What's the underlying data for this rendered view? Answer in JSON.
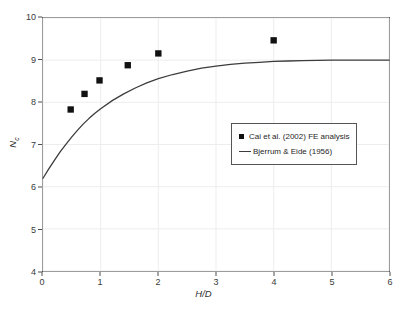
{
  "chart_data": {
    "type": "scatter",
    "title": "",
    "xlabel": "H/D",
    "ylabel": "Nc",
    "ylabel_base": "N",
    "ylabel_sub": "c",
    "xlim": [
      0,
      6
    ],
    "ylim": [
      4,
      10
    ],
    "xticks": [
      "0",
      "1",
      "2",
      "3",
      "4",
      "5",
      "6"
    ],
    "yticks": [
      "4",
      "5",
      "6",
      "7",
      "8",
      "9",
      "10"
    ],
    "grid": true,
    "legend_position": "center-right",
    "series": [
      {
        "name": "Cai et al. (2002) FE analysis",
        "type": "scatter",
        "marker": "square",
        "color": "#111111",
        "x": [
          0.48,
          0.72,
          0.98,
          1.47,
          2.0,
          4.0
        ],
        "y": [
          7.83,
          8.2,
          8.52,
          8.88,
          9.16,
          9.47
        ]
      },
      {
        "name": "Bjerrum & Eide (1956)",
        "type": "line",
        "color": "#3c3c3c",
        "x": [
          0,
          0.1,
          0.2,
          0.3,
          0.4,
          0.5,
          0.6,
          0.7,
          0.8,
          0.9,
          1.0,
          1.2,
          1.4,
          1.6,
          1.8,
          2.0,
          2.25,
          2.5,
          2.75,
          3.0,
          3.25,
          3.5,
          3.75,
          4.0,
          4.25,
          4.5,
          5.0,
          5.5,
          6.0
        ],
        "y": [
          6.2,
          6.42,
          6.63,
          6.83,
          7.01,
          7.18,
          7.34,
          7.49,
          7.62,
          7.74,
          7.85,
          8.04,
          8.2,
          8.34,
          8.46,
          8.56,
          8.66,
          8.74,
          8.81,
          8.86,
          8.9,
          8.93,
          8.95,
          8.97,
          8.98,
          8.99,
          9.0,
          9.0,
          9.0
        ]
      }
    ]
  }
}
